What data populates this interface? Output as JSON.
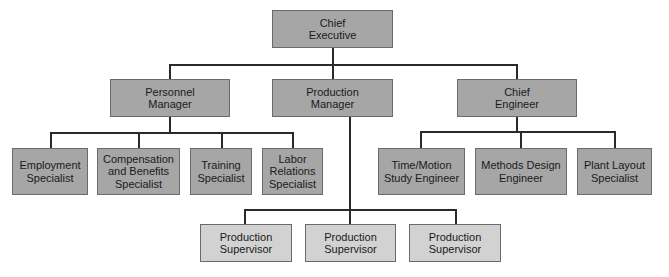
{
  "chart": {
    "type": "organization-chart",
    "root": {
      "label": "Chief\nExecutive",
      "children": [
        {
          "label": "Personnel\nManager",
          "children": [
            {
              "label": "Employment\nSpecialist"
            },
            {
              "label": "Compensation\nand Benefits\nSpecialist"
            },
            {
              "label": "Training\nSpecialist"
            },
            {
              "label": "Labor\nRelations\nSpecialist"
            }
          ]
        },
        {
          "label": "Production\nManager",
          "children": [
            {
              "label": "Production\nSupervisor"
            },
            {
              "label": "Production\nSupervisor"
            },
            {
              "label": "Production\nSupervisor"
            }
          ]
        },
        {
          "label": "Chief\nEngineer",
          "children": [
            {
              "label": "Time/Motion\nStudy Engineer"
            },
            {
              "label": "Methods Design\nEngineer"
            },
            {
              "label": "Plant Layout\nSpecialist"
            }
          ]
        }
      ]
    }
  },
  "colors": {
    "manager_fill": "#a6a6a6",
    "staff_fill": "#d2d2d2",
    "line": "#2a2a2a"
  }
}
